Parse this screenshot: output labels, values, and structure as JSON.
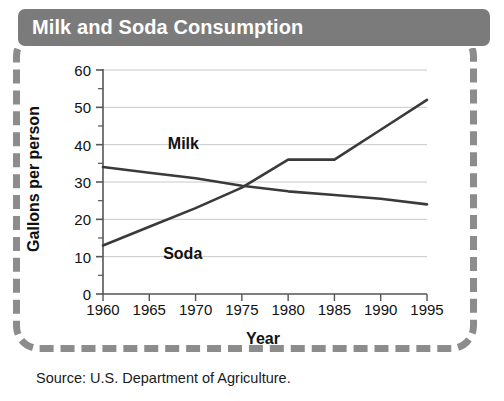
{
  "title": "Milk and Soda Consumption",
  "caption": "Source: U.S. Department of Agriculture.",
  "colors": {
    "title_bar": "#7b7b7b",
    "title_text": "#ffffff",
    "frame_dash": "#8c8c8c",
    "line": "#3a3a3a",
    "grid": "#c9c9c9",
    "axis": "#555555"
  },
  "chart_data": {
    "type": "line",
    "title": "Milk and Soda Consumption",
    "xlabel": "Year",
    "ylabel": "Gallons per person",
    "x": [
      1960,
      1965,
      1970,
      1975,
      1980,
      1985,
      1990,
      1995
    ],
    "xlim": [
      1960,
      1995
    ],
    "ylim": [
      0,
      60
    ],
    "ytick_labels": [
      "0",
      "10",
      "20",
      "30",
      "40",
      "50",
      "60"
    ],
    "yticks": [
      0,
      10,
      20,
      30,
      40,
      50,
      60
    ],
    "yticks_minor": [
      5,
      15,
      25,
      35,
      45,
      55
    ],
    "xtick_labels": [
      "1960",
      "1965",
      "1970",
      "1975",
      "1980",
      "1985",
      "1990",
      "1995"
    ],
    "grid": "horizontal",
    "legend": "inline-labels",
    "series": [
      {
        "name": "Milk",
        "values": [
          34,
          32.5,
          31,
          29,
          27.5,
          26.5,
          25.5,
          24
        ],
        "label_x": 1967,
        "label_y": 40
      },
      {
        "name": "Soda",
        "values": [
          13,
          18,
          23,
          28.5,
          36,
          36,
          44,
          52
        ],
        "label_x": 1966.5,
        "label_y": 10.5
      }
    ]
  }
}
